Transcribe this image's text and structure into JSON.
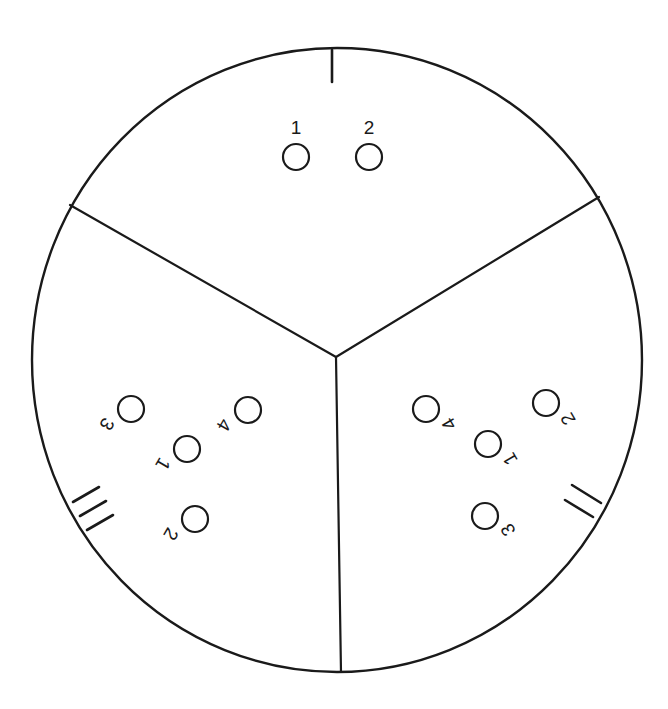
{
  "diagram": {
    "type": "circular sectioned layout",
    "colors": {
      "stroke": "#1a1a1a",
      "background": "#ffffff"
    },
    "outer_circle": {
      "cx": 337,
      "cy": 360,
      "rx": 305,
      "ry": 312
    },
    "center_junction": {
      "x": 336,
      "y": 357
    },
    "dividers": [
      {
        "id": "divider-left",
        "x1": 336,
        "y1": 357,
        "x2": 70,
        "y2": 205
      },
      {
        "id": "divider-right",
        "x1": 336,
        "y1": 357,
        "x2": 599,
        "y2": 197
      },
      {
        "id": "divider-bottom",
        "x1": 336,
        "y1": 357,
        "x2": 341,
        "y2": 672
      }
    ],
    "sections": [
      {
        "id": "section-1",
        "numeral": "I",
        "marker_strokes": [
          {
            "x1": 332,
            "y1": 50,
            "x2": 332,
            "y2": 82
          }
        ],
        "label_rotation": 0,
        "holes": [
          {
            "label": "1",
            "cx": 296,
            "cy": 157,
            "r": 13,
            "lx": 296,
            "ly": 127
          },
          {
            "label": "2",
            "cx": 369,
            "cy": 157,
            "r": 13,
            "lx": 369,
            "ly": 127
          }
        ]
      },
      {
        "id": "section-2",
        "numeral": "II",
        "marker_strokes": [
          {
            "x1": 572,
            "y1": 485,
            "x2": 601,
            "y2": 503
          },
          {
            "x1": 565,
            "y1": 500,
            "x2": 593,
            "y2": 517
          }
        ],
        "label_rotation": -120,
        "holes": [
          {
            "label": "4",
            "cx": 426,
            "cy": 409,
            "r": 13,
            "lx": 449,
            "ly": 424
          },
          {
            "label": "1",
            "cx": 488,
            "cy": 444,
            "r": 13,
            "lx": 510,
            "ly": 459
          },
          {
            "label": "2",
            "cx": 546,
            "cy": 403,
            "r": 13,
            "lx": 568,
            "ly": 419
          },
          {
            "label": "3",
            "cx": 485,
            "cy": 516,
            "r": 13,
            "lx": 508,
            "ly": 530
          }
        ]
      },
      {
        "id": "section-3",
        "numeral": "III",
        "marker_strokes": [
          {
            "x1": 73,
            "y1": 502,
            "x2": 99,
            "y2": 487
          },
          {
            "x1": 80,
            "y1": 516,
            "x2": 106,
            "y2": 501
          },
          {
            "x1": 87,
            "y1": 530,
            "x2": 113,
            "y2": 515
          }
        ],
        "label_rotation": 120,
        "holes": [
          {
            "label": "3",
            "cx": 131,
            "cy": 409,
            "r": 13,
            "lx": 107,
            "ly": 424
          },
          {
            "label": "1",
            "cx": 187,
            "cy": 449,
            "r": 13,
            "lx": 163,
            "ly": 464
          },
          {
            "label": "4",
            "cx": 248,
            "cy": 410,
            "r": 13,
            "lx": 224,
            "ly": 425
          },
          {
            "label": "2",
            "cx": 195,
            "cy": 519,
            "r": 13,
            "lx": 171,
            "ly": 534
          }
        ]
      }
    ]
  }
}
